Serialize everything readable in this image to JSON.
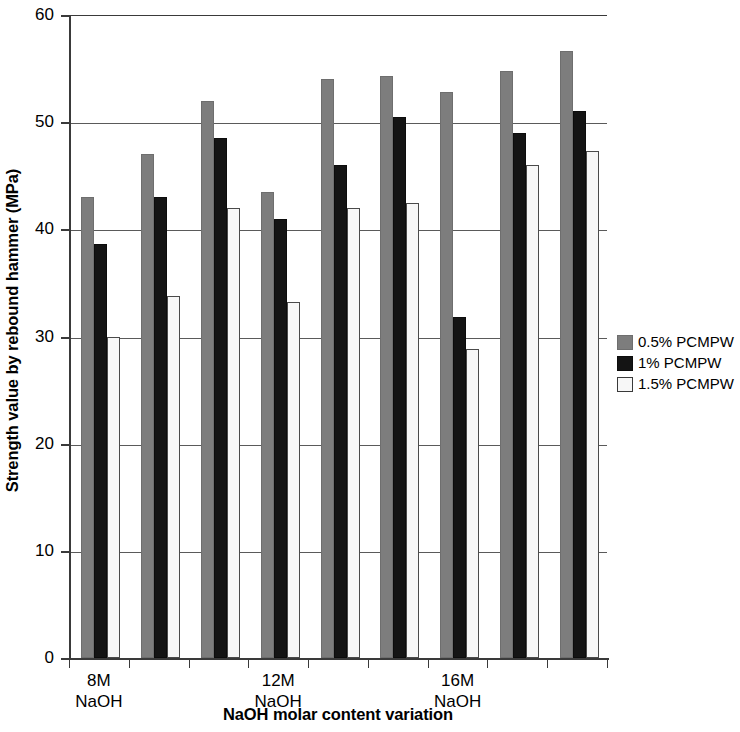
{
  "chart_data": {
    "type": "bar",
    "title": "",
    "subtitle": "",
    "xlabel": "NaOH molar content variation",
    "ylabel": "Strength value by rebound hammer (MPa)",
    "ylim": [
      0,
      60
    ],
    "ytick_labels": [
      "0",
      "10",
      "20",
      "30",
      "40",
      "50",
      "60"
    ],
    "ytick_values": [
      0,
      10,
      20,
      30,
      40,
      50,
      60
    ],
    "grid": true,
    "legend_position": "right",
    "group_count": 9,
    "categories": [
      "8M NaOH",
      "",
      "",
      "12M NaOH",
      "",
      "",
      "16M NaOH",
      "",
      ""
    ],
    "labeled_tick_texts": [
      {
        "line1": "8M",
        "line2": "NaOH"
      },
      {
        "line1": "12M",
        "line2": "NaOH"
      },
      {
        "line1": "16M",
        "line2": "NaOH"
      }
    ],
    "series": [
      {
        "name": "0.5% PCMPW",
        "color": "#7d7d7d",
        "values": [
          43.0,
          47.0,
          52.0,
          43.5,
          54.0,
          54.3,
          52.8,
          54.8,
          56.6
        ]
      },
      {
        "name": "1% PCMPW",
        "color": "#141414",
        "values": [
          38.6,
          43.0,
          48.5,
          41.0,
          46.0,
          50.5,
          31.8,
          49.0,
          51.0
        ]
      },
      {
        "name": "1.5% PCMPW",
        "color": "#f7f7f7",
        "values": [
          30.0,
          33.8,
          42.0,
          33.2,
          42.0,
          42.5,
          28.8,
          46.0,
          47.3
        ]
      }
    ]
  }
}
